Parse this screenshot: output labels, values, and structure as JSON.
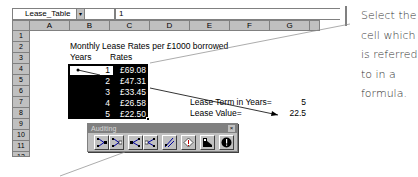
{
  "formula_bar": {
    "name_box": "Lease_Table",
    "name_box_arrow": "▾",
    "formula": "1"
  },
  "columns": [
    "A",
    "B",
    "C",
    "D",
    "E",
    "F",
    "G"
  ],
  "rows": [
    "1",
    "2",
    "3",
    "4",
    "5",
    "6",
    "7",
    "8",
    "9",
    "10",
    "11",
    "12"
  ],
  "sheet": {
    "title": "Monthly Lease Rates per £1000 borrowed",
    "header_years": "Years",
    "header_rates": "Rates",
    "table": [
      {
        "years": "1",
        "rate": "£69.08"
      },
      {
        "years": "2",
        "rate": "£47.31"
      },
      {
        "years": "3",
        "rate": "£33.45"
      },
      {
        "years": "4",
        "rate": "£26.58"
      },
      {
        "years": "5",
        "rate": "£22.50"
      }
    ],
    "lease_term_label": "Lease Term in Years=",
    "lease_term_value": "5",
    "lease_value_label": "Lease Value=",
    "lease_value_value": "22.5"
  },
  "toolbar": {
    "title": "Auditing",
    "close": "×",
    "buttons": [
      {
        "name": "trace-precedents",
        "icon": "trace-precedents-icon"
      },
      {
        "name": "remove-precedent-arrows",
        "icon": "remove-precedent-arrows-icon"
      },
      {
        "name": "trace-dependents",
        "icon": "trace-dependents-icon"
      },
      {
        "name": "remove-dependent-arrows",
        "icon": "remove-dependent-arrows-icon"
      },
      {
        "name": "remove-all-arrows",
        "icon": "remove-all-arrows-icon"
      },
      {
        "name": "trace-error",
        "icon": "trace-error-icon"
      },
      {
        "name": "new-comment",
        "icon": "new-comment-icon"
      },
      {
        "name": "circle-invalid-data",
        "icon": "circle-invalid-data-icon"
      }
    ]
  },
  "annotation": {
    "text": "Select the cell which is referred to in a formula."
  }
}
